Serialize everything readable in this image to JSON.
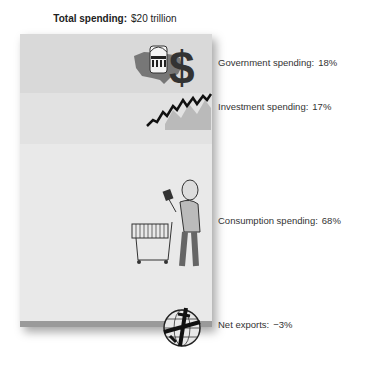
{
  "title": {
    "label": "Total spending:",
    "value": "$20 trillion"
  },
  "components": [
    {
      "name": "Government spending:",
      "pct": "18%",
      "icon": "government-dollar-icon"
    },
    {
      "name": "Investment spending:",
      "pct": "17%",
      "icon": "rising-graph-icon"
    },
    {
      "name": "Consumption spending:",
      "pct": "68%",
      "icon": "shopper-cart-icon"
    },
    {
      "name": "Net exports:",
      "pct": "−3%",
      "icon": "globe-airplane-icon"
    }
  ],
  "colors": {
    "government": "#d9d9d9",
    "investment": "#e2e2e2",
    "consumption": "#e9e9e9",
    "net_exports": "#9a9a9a"
  }
}
